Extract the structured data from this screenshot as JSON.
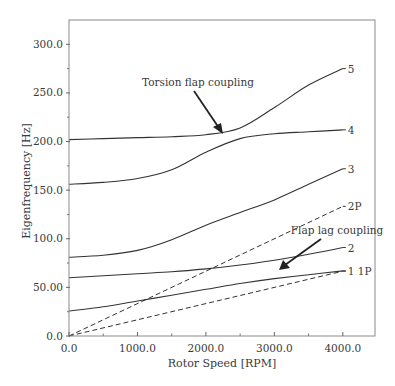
{
  "chart_data": {
    "type": "line",
    "title": "",
    "xlabel": "Rotor Speed [RPM]",
    "ylabel": "Eigenfrequency [Hz]",
    "xlim": [
      0,
      4470
    ],
    "ylim": [
      0,
      325
    ],
    "grid": false,
    "legend": "none (inline curve labels)",
    "x_ticks": [
      {
        "value": 0,
        "label": "0.0"
      },
      {
        "value": 1000,
        "label": "1000.0"
      },
      {
        "value": 2000,
        "label": "2000.0"
      },
      {
        "value": 3000,
        "label": "3000.0"
      },
      {
        "value": 4000,
        "label": "4000.0"
      }
    ],
    "x_minor_ticks": [
      500,
      1500,
      2500,
      3500
    ],
    "y_ticks": [
      {
        "value": 0,
        "label": "0.0"
      },
      {
        "value": 50,
        "label": "50.00"
      },
      {
        "value": 100,
        "label": "100.0"
      },
      {
        "value": 150,
        "label": "150.0"
      },
      {
        "value": 200,
        "label": "200.0"
      },
      {
        "value": 250,
        "label": "250.0"
      },
      {
        "value": 300,
        "label": "300.0"
      }
    ],
    "y_minor_ticks": [
      25,
      75,
      125,
      175,
      225,
      275
    ],
    "x": [
      0,
      500,
      1000,
      1500,
      2000,
      2500,
      3000,
      3500,
      4000
    ],
    "series": [
      {
        "name": "1",
        "label": "1",
        "style": "solid",
        "values": [
          25.7,
          30,
          36,
          42,
          48,
          54,
          59,
          63,
          67
        ]
      },
      {
        "name": "2",
        "label": "2",
        "style": "solid",
        "values": [
          60,
          62,
          64,
          66,
          69,
          73,
          78,
          84,
          91
        ]
      },
      {
        "name": "3",
        "label": "3",
        "style": "solid",
        "values": [
          81,
          83,
          88,
          99,
          114,
          127,
          140,
          156,
          172
        ]
      },
      {
        "name": "4",
        "label": "4",
        "style": "solid",
        "values": [
          156,
          158,
          162,
          171,
          189,
          203,
          208,
          210,
          212
        ]
      },
      {
        "name": "5",
        "label": "5",
        "style": "solid",
        "values": [
          202,
          203,
          204,
          205,
          207,
          214,
          235,
          258,
          275
        ]
      },
      {
        "name": "1P",
        "label": "1P",
        "style": "dashed",
        "values": [
          0,
          8.33,
          16.67,
          25,
          33.33,
          41.67,
          50,
          58.33,
          66.67
        ]
      },
      {
        "name": "2P",
        "label": "2P",
        "style": "dashed",
        "values": [
          0,
          16.67,
          33.33,
          50,
          66.67,
          83.33,
          100,
          116.67,
          133.33
        ]
      }
    ],
    "annotations": [
      {
        "text": "Torsion flap coupling",
        "arrow_to": {
          "x": 2250,
          "y": 209
        }
      },
      {
        "text": "Flap lag coupling",
        "arrow_to": {
          "x": 3040,
          "y": 69
        }
      }
    ]
  }
}
